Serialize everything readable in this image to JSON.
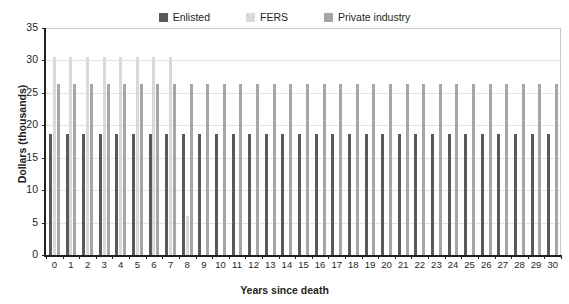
{
  "chart_data": {
    "type": "bar",
    "title": "",
    "xlabel": "Years since death",
    "ylabel": "Dollars (thousands)",
    "categories": [
      "0",
      "1",
      "2",
      "3",
      "4",
      "5",
      "6",
      "7",
      "8",
      "9",
      "10",
      "11",
      "12",
      "13",
      "14",
      "15",
      "16",
      "17",
      "18",
      "19",
      "20",
      "21",
      "22",
      "23",
      "24",
      "25",
      "26",
      "27",
      "28",
      "29",
      "30"
    ],
    "series": [
      {
        "name": "Enlisted",
        "color": "#595959",
        "values": [
          18.7,
          18.7,
          18.7,
          18.7,
          18.7,
          18.7,
          18.7,
          18.7,
          18.7,
          18.7,
          18.7,
          18.7,
          18.7,
          18.7,
          18.7,
          18.7,
          18.7,
          18.7,
          18.7,
          18.7,
          18.7,
          18.7,
          18.7,
          18.7,
          18.7,
          18.7,
          18.7,
          18.7,
          18.7,
          18.7,
          18.7
        ]
      },
      {
        "name": "FERS",
        "color": "#d9d9d9",
        "values": [
          30.6,
          30.6,
          30.6,
          30.6,
          30.6,
          30.6,
          30.6,
          30.6,
          6.0,
          0,
          0,
          0,
          0,
          0,
          0,
          0,
          0,
          0,
          0,
          0,
          0,
          0,
          0,
          0,
          0,
          0,
          0,
          0,
          0,
          0,
          0
        ]
      },
      {
        "name": "Private industry",
        "color": "#a6a6a6",
        "values": [
          26.3,
          26.3,
          26.3,
          26.3,
          26.3,
          26.3,
          26.3,
          26.3,
          26.3,
          26.3,
          26.3,
          26.3,
          26.3,
          26.3,
          26.3,
          26.3,
          26.3,
          26.3,
          26.3,
          26.3,
          26.3,
          26.3,
          26.3,
          26.3,
          26.3,
          26.3,
          26.3,
          26.3,
          26.3,
          26.3,
          26.3
        ]
      }
    ],
    "ylim": [
      0,
      35
    ],
    "yticks": [
      0,
      5,
      10,
      15,
      20,
      25,
      30,
      35
    ],
    "ytick_labels": [
      "0",
      "5",
      "10",
      "15",
      "20",
      "25",
      "30",
      "35"
    ],
    "grid": true,
    "legend_position": "top-center",
    "background": "#ffffff",
    "axis_color": "#231f20",
    "gridline_color": "#e3e3e3"
  },
  "legend": {
    "items": [
      {
        "label": "Enlisted",
        "color": "#595959"
      },
      {
        "label": "FERS",
        "color": "#d9d9d9"
      },
      {
        "label": "Private industry",
        "color": "#a6a6a6"
      }
    ]
  }
}
